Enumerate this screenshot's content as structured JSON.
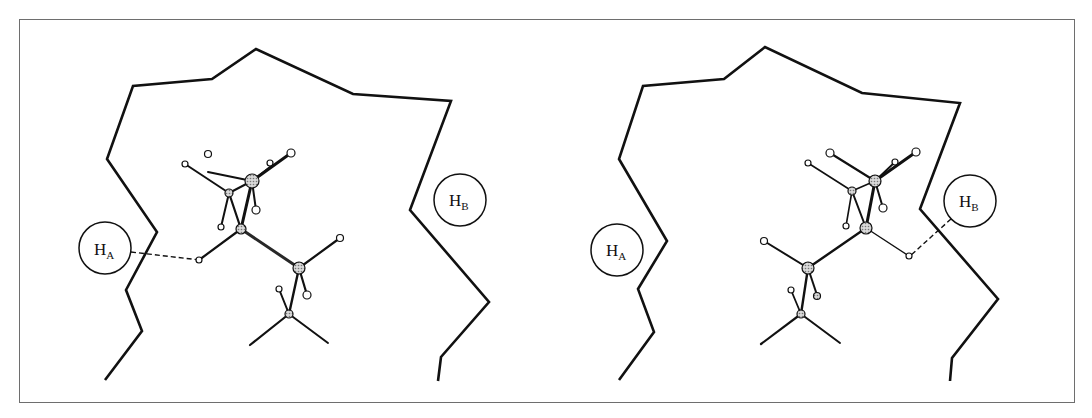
{
  "figure": {
    "panels": [
      {
        "id": "left",
        "labels": {
          "ha": "H",
          "ha_sub": "A",
          "hb": "H",
          "hb_sub": "B"
        },
        "hydrogen_bond_to": "HA"
      },
      {
        "id": "right",
        "labels": {
          "ha": "H",
          "ha_sub": "A",
          "hb": "H",
          "hb_sub": "B"
        },
        "hydrogen_bond_to": "HB"
      }
    ],
    "colors": {
      "line": "#111111",
      "atom_fill": "#bdbdbd",
      "frame": "#6e6e6e"
    }
  }
}
